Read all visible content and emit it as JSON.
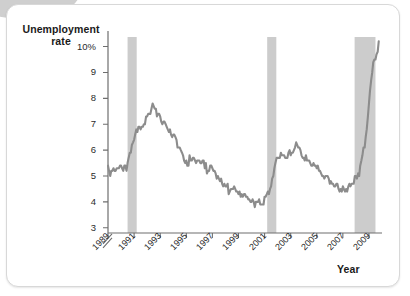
{
  "figure": {
    "y_axis_title_line1": "Unemployment",
    "y_axis_title_line2": "rate",
    "x_axis_title": "Year",
    "line_color": "#8c8c8c",
    "recession_band_color": "#cccccc",
    "axis_color": "#6e6e6e",
    "background_color": "#ffffff"
  },
  "chart_data": {
    "type": "line",
    "title": "",
    "xlabel": "Year",
    "ylabel": "Unemployment rate",
    "ylim": [
      2.8,
      10.6
    ],
    "xlim": [
      1989.0,
      2010.0
    ],
    "grid": false,
    "legend": null,
    "axis_break": true,
    "y_ticks": [
      3,
      4,
      5,
      6,
      7,
      8,
      9,
      10
    ],
    "y_tick_labels": [
      "3",
      "4",
      "5",
      "6",
      "7",
      "8",
      "9",
      "10%"
    ],
    "x_ticks": [
      1989,
      1991,
      1993,
      1995,
      1997,
      1999,
      2001,
      2003,
      2005,
      2007,
      2009
    ],
    "x_tick_labels": [
      "1989",
      "1991",
      "1993",
      "1995",
      "1997",
      "1999",
      "2001",
      "2003",
      "2005",
      "2007",
      "2009"
    ],
    "series": [
      {
        "name": "Unemployment rate",
        "unit": "percent",
        "x": [
          1989.0,
          1989.08,
          1989.17,
          1989.25,
          1989.33,
          1989.42,
          1989.5,
          1989.58,
          1989.67,
          1989.75,
          1989.83,
          1989.92,
          1990.0,
          1990.08,
          1990.17,
          1990.25,
          1990.33,
          1990.42,
          1990.5,
          1990.58,
          1990.67,
          1990.75,
          1990.83,
          1990.92,
          1991.0,
          1991.08,
          1991.17,
          1991.25,
          1991.33,
          1991.42,
          1991.5,
          1991.58,
          1991.67,
          1991.75,
          1991.83,
          1991.92,
          1992.0,
          1992.08,
          1992.17,
          1992.25,
          1992.33,
          1992.42,
          1992.5,
          1992.58,
          1992.67,
          1992.75,
          1992.83,
          1992.92,
          1993.0,
          1993.08,
          1993.17,
          1993.25,
          1993.33,
          1993.42,
          1993.5,
          1993.58,
          1993.67,
          1993.75,
          1993.83,
          1993.92,
          1994.0,
          1994.08,
          1994.17,
          1994.25,
          1994.33,
          1994.42,
          1994.5,
          1994.58,
          1994.67,
          1994.75,
          1994.83,
          1994.92,
          1995.0,
          1995.08,
          1995.17,
          1995.25,
          1995.33,
          1995.42,
          1995.5,
          1995.58,
          1995.67,
          1995.75,
          1995.83,
          1995.92,
          1996.0,
          1996.08,
          1996.17,
          1996.25,
          1996.33,
          1996.42,
          1996.5,
          1996.58,
          1996.67,
          1996.75,
          1996.83,
          1996.92,
          1997.0,
          1997.08,
          1997.17,
          1997.25,
          1997.33,
          1997.42,
          1997.5,
          1997.58,
          1997.67,
          1997.75,
          1997.83,
          1997.92,
          1998.0,
          1998.08,
          1998.17,
          1998.25,
          1998.33,
          1998.42,
          1998.5,
          1998.58,
          1998.67,
          1998.75,
          1998.83,
          1998.92,
          1999.0,
          1999.08,
          1999.17,
          1999.25,
          1999.33,
          1999.42,
          1999.5,
          1999.58,
          1999.67,
          1999.75,
          1999.83,
          1999.92,
          2000.0,
          2000.08,
          2000.17,
          2000.25,
          2000.33,
          2000.42,
          2000.5,
          2000.58,
          2000.67,
          2000.75,
          2000.83,
          2000.92,
          2001.0,
          2001.08,
          2001.17,
          2001.25,
          2001.33,
          2001.42,
          2001.5,
          2001.58,
          2001.67,
          2001.75,
          2001.83,
          2001.92,
          2002.0,
          2002.08,
          2002.17,
          2002.25,
          2002.33,
          2002.42,
          2002.5,
          2002.58,
          2002.67,
          2002.75,
          2002.83,
          2002.92,
          2003.0,
          2003.08,
          2003.17,
          2003.25,
          2003.33,
          2003.42,
          2003.5,
          2003.58,
          2003.67,
          2003.75,
          2003.83,
          2003.92,
          2004.0,
          2004.08,
          2004.17,
          2004.25,
          2004.33,
          2004.42,
          2004.5,
          2004.58,
          2004.67,
          2004.75,
          2004.83,
          2004.92,
          2005.0,
          2005.08,
          2005.17,
          2005.25,
          2005.33,
          2005.42,
          2005.5,
          2005.58,
          2005.67,
          2005.75,
          2005.83,
          2005.92,
          2006.0,
          2006.08,
          2006.17,
          2006.25,
          2006.33,
          2006.42,
          2006.5,
          2006.58,
          2006.67,
          2006.75,
          2006.83,
          2006.92,
          2007.0,
          2007.08,
          2007.17,
          2007.25,
          2007.33,
          2007.42,
          2007.5,
          2007.58,
          2007.67,
          2007.75,
          2007.83,
          2007.92,
          2008.0,
          2008.08,
          2008.17,
          2008.25,
          2008.33,
          2008.42,
          2008.5,
          2008.58,
          2008.67,
          2008.75,
          2008.83,
          2008.92,
          2009.0,
          2009.08,
          2009.17,
          2009.25,
          2009.33,
          2009.42,
          2009.5,
          2009.58,
          2009.67,
          2009.75
        ],
        "values": [
          5.4,
          5.2,
          5.0,
          5.2,
          5.2,
          5.3,
          5.2,
          5.2,
          5.3,
          5.3,
          5.3,
          5.4,
          5.4,
          5.3,
          5.2,
          5.4,
          5.4,
          5.2,
          5.5,
          5.7,
          5.9,
          5.9,
          6.2,
          6.3,
          6.4,
          6.6,
          6.8,
          6.7,
          6.9,
          6.9,
          6.8,
          6.9,
          6.9,
          7.0,
          7.0,
          7.3,
          7.3,
          7.4,
          7.4,
          7.4,
          7.6,
          7.8,
          7.7,
          7.6,
          7.6,
          7.3,
          7.4,
          7.4,
          7.3,
          7.1,
          7.0,
          7.1,
          7.1,
          7.0,
          6.9,
          6.8,
          6.7,
          6.8,
          6.6,
          6.5,
          6.6,
          6.6,
          6.5,
          6.4,
          6.1,
          6.1,
          6.1,
          6.0,
          5.9,
          5.8,
          5.6,
          5.5,
          5.6,
          5.4,
          5.4,
          5.8,
          5.6,
          5.6,
          5.7,
          5.7,
          5.6,
          5.5,
          5.6,
          5.6,
          5.6,
          5.5,
          5.5,
          5.6,
          5.6,
          5.3,
          5.5,
          5.1,
          5.2,
          5.2,
          5.4,
          5.4,
          5.3,
          5.2,
          5.2,
          5.1,
          4.9,
          5.0,
          4.9,
          4.8,
          4.9,
          4.7,
          4.6,
          4.7,
          4.6,
          4.6,
          4.7,
          4.3,
          4.4,
          4.5,
          4.5,
          4.5,
          4.6,
          4.5,
          4.4,
          4.4,
          4.3,
          4.4,
          4.2,
          4.3,
          4.2,
          4.3,
          4.3,
          4.2,
          4.2,
          4.1,
          4.1,
          4.0,
          4.0,
          4.1,
          4.0,
          3.8,
          4.0,
          4.0,
          4.0,
          4.1,
          3.9,
          3.9,
          3.9,
          3.9,
          4.2,
          4.2,
          4.3,
          4.4,
          4.3,
          4.5,
          4.6,
          4.9,
          5.0,
          5.3,
          5.5,
          5.7,
          5.7,
          5.7,
          5.7,
          5.9,
          5.8,
          5.8,
          5.8,
          5.7,
          5.7,
          5.7,
          5.9,
          6.0,
          5.8,
          5.9,
          5.9,
          6.0,
          6.1,
          6.3,
          6.2,
          6.1,
          6.1,
          6.0,
          5.8,
          5.7,
          5.7,
          5.6,
          5.8,
          5.6,
          5.6,
          5.6,
          5.5,
          5.4,
          5.4,
          5.5,
          5.4,
          5.4,
          5.3,
          5.4,
          5.2,
          5.2,
          5.1,
          5.0,
          5.0,
          4.9,
          5.0,
          5.0,
          5.0,
          4.9,
          4.7,
          4.8,
          4.7,
          4.7,
          4.6,
          4.6,
          4.7,
          4.7,
          4.5,
          4.4,
          4.5,
          4.4,
          4.6,
          4.5,
          4.4,
          4.5,
          4.4,
          4.6,
          4.7,
          4.6,
          4.7,
          4.7,
          4.7,
          5.0,
          5.0,
          4.9,
          5.1,
          5.0,
          5.4,
          5.6,
          5.8,
          6.1,
          6.1,
          6.5,
          6.8,
          7.3,
          7.8,
          8.3,
          8.7,
          9.0,
          9.4,
          9.5,
          9.5,
          9.7,
          9.8,
          10.2
        ]
      }
    ],
    "recession_bands": [
      {
        "label": "1990-91 recession",
        "start": 1990.5,
        "end": 1991.2
      },
      {
        "label": "2001 recession",
        "start": 2001.2,
        "end": 2001.9
      },
      {
        "label": "2007-09 recession",
        "start": 2007.9,
        "end": 2009.5
      }
    ]
  }
}
